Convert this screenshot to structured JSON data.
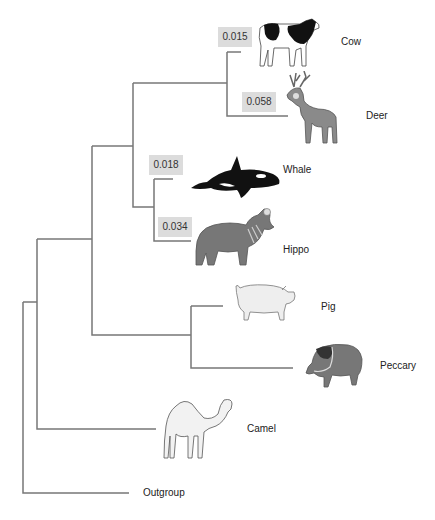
{
  "diagram": {
    "type": "phylogenetic-tree",
    "line_color": "#777777",
    "box_color": "#dcdcdc"
  },
  "taxa": [
    {
      "name": "Cow",
      "branch_length": "0.015"
    },
    {
      "name": "Deer",
      "branch_length": "0.058"
    },
    {
      "name": "Whale",
      "branch_length": "0.018"
    },
    {
      "name": "Hippo",
      "branch_length": "0.034"
    },
    {
      "name": "Pig"
    },
    {
      "name": "Peccary"
    },
    {
      "name": "Camel"
    },
    {
      "name": "Outgroup"
    }
  ],
  "icons": [
    "cow-icon",
    "deer-icon",
    "whale-icon",
    "hippo-icon",
    "pig-icon",
    "peccary-icon",
    "camel-icon"
  ]
}
